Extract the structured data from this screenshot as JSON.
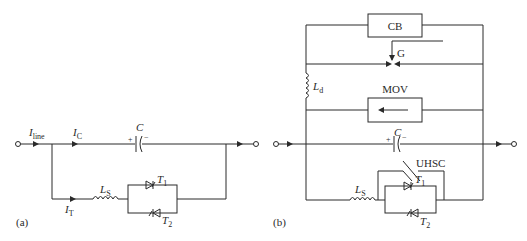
{
  "figure_a": {
    "panel_label": "(a)",
    "labels": {
      "I_line": {
        "main": "I",
        "sub": "line"
      },
      "I_C": {
        "main": "I",
        "sub": "C"
      },
      "I_T": {
        "main": "I",
        "sub": "T"
      },
      "C": "C",
      "cap_plus": "+",
      "cap_minus": "−",
      "L_S": {
        "main": "L",
        "sub": "S"
      },
      "T1": {
        "main": "T",
        "sub": "1"
      },
      "T2": {
        "main": "T",
        "sub": "2"
      }
    }
  },
  "figure_b": {
    "panel_label": "(b)",
    "labels": {
      "CB": "CB",
      "G": "G",
      "L_d": {
        "main": "L",
        "sub": "d"
      },
      "MOV": "MOV",
      "C": "C",
      "cap_plus": "+",
      "cap_minus": "−",
      "UHSC": "UHSC",
      "L_S": {
        "main": "L",
        "sub": "S"
      },
      "T1": {
        "main": "T",
        "sub": "1"
      },
      "T2": {
        "main": "T",
        "sub": "2"
      }
    }
  }
}
